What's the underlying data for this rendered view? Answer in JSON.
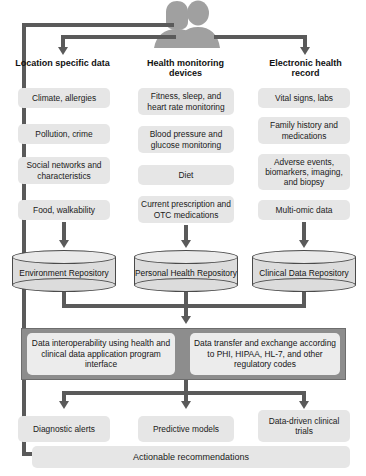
{
  "diagram": {
    "source_icon": "two-people-icon",
    "colors": {
      "chip_fill": "#e6e6e6",
      "band_fill": "#8d8d8d",
      "band_box_fill": "#ececec",
      "connector": "#5a5a5a",
      "cylinder_fill": "#dcdcdc",
      "cylinder_stroke": "#4a4a4a",
      "text": "#1a1a1a",
      "background": "#ffffff"
    }
  },
  "columns": [
    {
      "id": "location-specific-data",
      "header": "Location specific data",
      "items": [
        "Climate, allergies",
        "Pollution, crime",
        "Social networks and characteristics",
        "Food, walkability"
      ],
      "repository": "Environment Repository"
    },
    {
      "id": "health-monitoring-devices",
      "header": "Health monitoring devices",
      "items": [
        "Fitness, sleep, and heart rate monitoring",
        "Blood pressure and glucose monitoring",
        "Diet",
        "Current prescription and OTC medications"
      ],
      "repository": "Personal Health Repository"
    },
    {
      "id": "electronic-health-record",
      "header": "Electronic health record",
      "items": [
        "Vital signs, labs",
        "Family history and medications",
        "Adverse events, biomarkers, imaging, and biopsy",
        "Multi-omic data"
      ],
      "repository": "Clinical Data Repository"
    }
  ],
  "interoperability_band": {
    "left_box": "Data interoperability using health and clinical data application program interface",
    "right_box": "Data transfer and exchange according to PHI, HIPAA, HL-7, and other regulatory codes"
  },
  "outcomes": [
    "Diagnostic alerts",
    "Predictive models",
    "Data-driven clinical trials"
  ],
  "final_bar": "Actionable recommendations"
}
